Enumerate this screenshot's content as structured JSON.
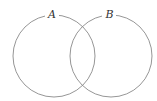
{
  "diagram": {
    "type": "venn",
    "sets": [
      {
        "id": "A",
        "label": "A",
        "cx": 54,
        "cy": 56,
        "r": 41
      },
      {
        "id": "B",
        "label": "B",
        "cx": 111,
        "cy": 56,
        "r": 41
      }
    ],
    "stroke_color": "#8a8a8a",
    "label_color": "#333333"
  }
}
